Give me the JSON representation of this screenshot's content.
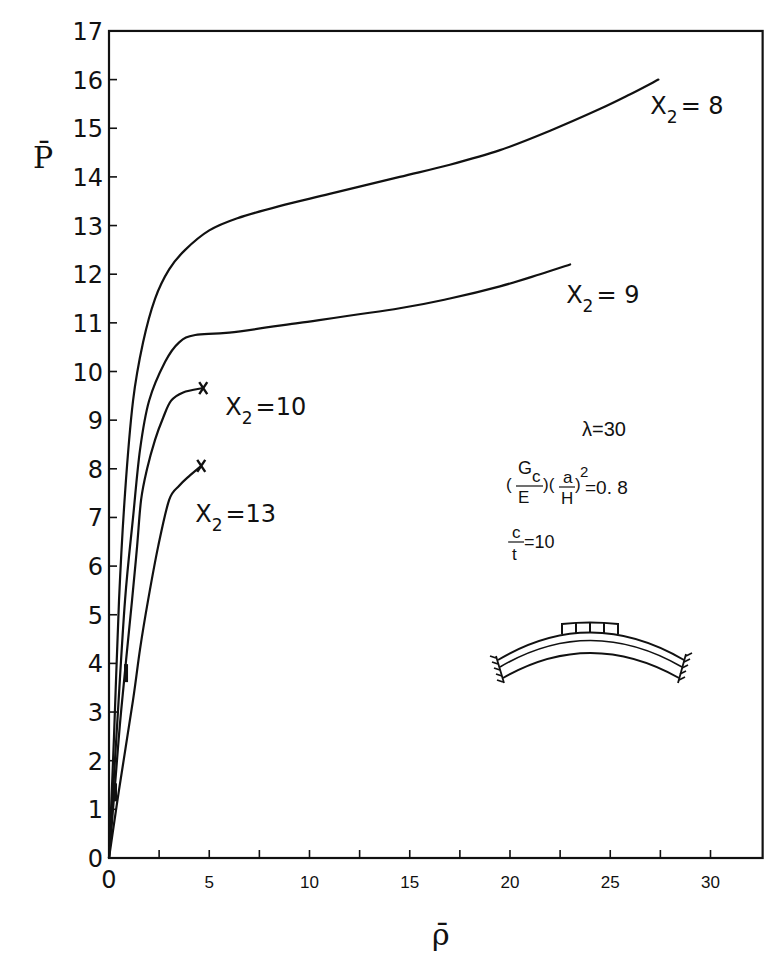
{
  "chart_data": {
    "type": "line",
    "title": "",
    "xlabel": "ρ̄",
    "ylabel": "P̄",
    "xlim": [
      0,
      32.6
    ],
    "ylim": [
      0,
      17
    ],
    "grid": false,
    "legend": "inline curve labels",
    "x_ticks": [
      0,
      2.5,
      5,
      7.5,
      10,
      12.5,
      15,
      17.5,
      20,
      22.5,
      25,
      27.5,
      30
    ],
    "x_tick_labels": [
      "0",
      "5",
      "10",
      "15",
      "20",
      "25",
      "30"
    ],
    "x_tick_label_values": [
      0,
      5,
      10,
      15,
      20,
      25,
      30
    ],
    "y_ticks": [
      0,
      1,
      2,
      3,
      4,
      5,
      6,
      7,
      8,
      9,
      10,
      11,
      12,
      13,
      14,
      15,
      16,
      17
    ],
    "y_tick_labels": [
      "0",
      "1",
      "2",
      "3",
      "4",
      "5",
      "6",
      "7",
      "8",
      "9",
      "10",
      "11",
      "12",
      "13",
      "14",
      "15",
      "16",
      "17"
    ],
    "series": [
      {
        "name": "X2 = 8",
        "label_main": "X",
        "label_sub": "2",
        "label_rest": "= 8",
        "label_pos": [
          27.0,
          15.3
        ],
        "end_marker": false,
        "points": [
          [
            0,
            0
          ],
          [
            0.25,
            2.5
          ],
          [
            0.5,
            5.3
          ],
          [
            0.8,
            7.5
          ],
          [
            1.2,
            9.4
          ],
          [
            1.7,
            10.6
          ],
          [
            2.3,
            11.5
          ],
          [
            3.0,
            12.1
          ],
          [
            3.8,
            12.5
          ],
          [
            5.0,
            12.9
          ],
          [
            6.4,
            13.15
          ],
          [
            8.5,
            13.4
          ],
          [
            11,
            13.65
          ],
          [
            14.5,
            14.0
          ],
          [
            17,
            14.25
          ],
          [
            19.5,
            14.55
          ],
          [
            22,
            14.95
          ],
          [
            24.5,
            15.4
          ],
          [
            26,
            15.7
          ],
          [
            27.4,
            16.0
          ]
        ]
      },
      {
        "name": "X2 = 9",
        "label_main": "X",
        "label_sub": "2",
        "label_rest": "= 9",
        "label_pos": [
          22.8,
          11.4
        ],
        "end_marker": false,
        "points": [
          [
            0,
            0
          ],
          [
            0.4,
            2.7
          ],
          [
            0.8,
            5.3
          ],
          [
            1.2,
            7.0
          ],
          [
            1.55,
            8.4
          ],
          [
            2.0,
            9.4
          ],
          [
            2.8,
            10.2
          ],
          [
            3.5,
            10.6
          ],
          [
            4.3,
            10.75
          ],
          [
            6.0,
            10.8
          ],
          [
            9.5,
            11.0
          ],
          [
            14.5,
            11.3
          ],
          [
            17,
            11.5
          ],
          [
            19.5,
            11.75
          ],
          [
            21.5,
            12.0
          ],
          [
            23.0,
            12.2
          ]
        ],
        "marker_segment": [
          [
            0.85,
            3.6
          ],
          [
            0.85,
            4.0
          ]
        ]
      },
      {
        "name": "X2 = 10",
        "label_main": "X",
        "label_sub": "2",
        "label_rest": "=10",
        "label_pos": [
          5.8,
          9.1
        ],
        "end_marker": true,
        "points": [
          [
            0,
            0
          ],
          [
            0.3,
            1.5
          ],
          [
            0.6,
            3.0
          ],
          [
            1.15,
            5.3
          ],
          [
            1.4,
            6.4
          ],
          [
            1.6,
            7.36
          ],
          [
            1.9,
            8.0
          ],
          [
            2.3,
            8.6
          ],
          [
            2.7,
            9.05
          ],
          [
            3.1,
            9.4
          ],
          [
            3.7,
            9.57
          ],
          [
            4.7,
            9.66
          ]
        ]
      },
      {
        "name": "X2 = 13",
        "label_main": "X",
        "label_sub": "2",
        "label_rest": "=13",
        "label_pos": [
          4.3,
          6.9
        ],
        "end_marker": true,
        "points": [
          [
            0,
            0
          ],
          [
            0.5,
            1.4
          ],
          [
            1.2,
            3.25
          ],
          [
            1.55,
            4.3
          ],
          [
            1.95,
            5.3
          ],
          [
            2.45,
            6.4
          ],
          [
            3.0,
            7.36
          ],
          [
            3.5,
            7.65
          ],
          [
            4.0,
            7.85
          ],
          [
            4.6,
            8.06
          ]
        ]
      }
    ],
    "markers": [
      {
        "at": [
          0.3,
          1.35
        ],
        "note": "short thick segment on curve"
      },
      {
        "at": [
          0.85,
          3.8
        ],
        "note": "short thick segment on curve"
      }
    ],
    "annotations": {
      "lambda": "λ=30",
      "param_open": "(",
      "param_Gc_G": "G",
      "param_Gc_c": "c",
      "param_E": "E",
      "param_mid": ")(",
      "param_a": "a",
      "param_H": "H",
      "param_close": ")",
      "param_exp": "2",
      "param_value": "=0. 8",
      "ct_c": "c",
      "ct_t": "t",
      "ct_value": "=10"
    },
    "inset_diagram": "curved shallow arch, clamped at both ends, with a four-segment distributed load block at the crown"
  }
}
